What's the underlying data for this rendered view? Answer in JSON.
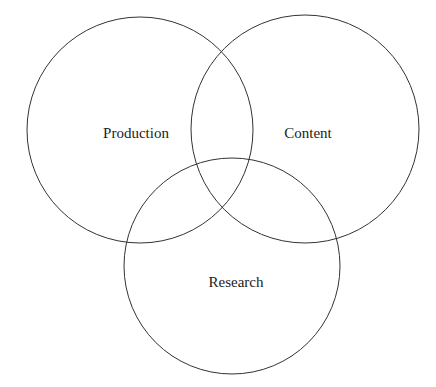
{
  "diagram": {
    "type": "venn",
    "sets": [
      {
        "id": "production",
        "label": "Production",
        "cx": 140,
        "cy": 130,
        "r": 113,
        "label_x": 136,
        "label_y": 138
      },
      {
        "id": "content",
        "label": "Content",
        "cx": 305,
        "cy": 129,
        "r": 114,
        "label_x": 308,
        "label_y": 138
      },
      {
        "id": "research",
        "label": "Research",
        "cx": 232,
        "cy": 266,
        "r": 108,
        "label_x": 236,
        "label_y": 287
      }
    ],
    "stroke_color": "#333333",
    "background": "#ffffff"
  }
}
